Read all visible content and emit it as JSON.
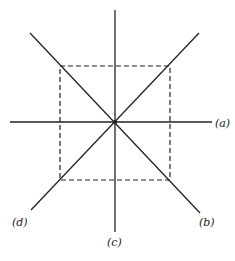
{
  "diagram": {
    "center": {
      "x": 115,
      "y": 122
    },
    "lines": [
      {
        "id": "a",
        "label": "(a)",
        "x1": 10,
        "y1": 122,
        "x2": 212,
        "y2": 122
      },
      {
        "id": "b",
        "label": "(b)",
        "x1": 30,
        "y1": 33,
        "x2": 200,
        "y2": 213
      },
      {
        "id": "c",
        "label": "(c)",
        "x1": 115,
        "y1": 10,
        "x2": 115,
        "y2": 232
      },
      {
        "id": "d",
        "label": "(d)",
        "x1": 31,
        "y1": 210,
        "x2": 199,
        "y2": 33
      }
    ],
    "dashed_square": {
      "x": 60,
      "y": 66,
      "width": 110,
      "height": 114
    },
    "labels": {
      "a": "(a)",
      "b": "(b)",
      "c": "(c)",
      "d": "(d)"
    }
  }
}
